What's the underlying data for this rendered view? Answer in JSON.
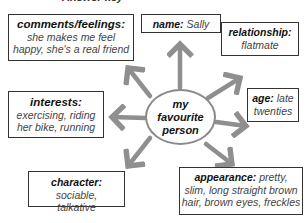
{
  "heading": "Answer key",
  "hub": {
    "line1": "my",
    "line2": "favourite",
    "line3": "person"
  },
  "nodes": {
    "comments": {
      "label": "comments/feelings:",
      "text1": "she makes me feel",
      "text2": "happy, she's a real friend"
    },
    "name": {
      "label": "name:",
      "text": "Sally"
    },
    "relationship": {
      "label": "relationship:",
      "text": "flatmate"
    },
    "interests": {
      "label": "interests:",
      "text1": "exercising, riding",
      "text2": "her bike, running"
    },
    "age": {
      "label": "age:",
      "text1": "late",
      "text2": "twenties"
    },
    "character": {
      "label": "character:",
      "text1": "sociable,",
      "text2": "talkative"
    },
    "appearance": {
      "label": "appearance:",
      "text1": "pretty,",
      "text2": "slim, long straight brown",
      "text3": "hair, brown eyes, freckles"
    }
  },
  "colors": {
    "arrow": "#8f8f8f",
    "border": "#333333"
  }
}
